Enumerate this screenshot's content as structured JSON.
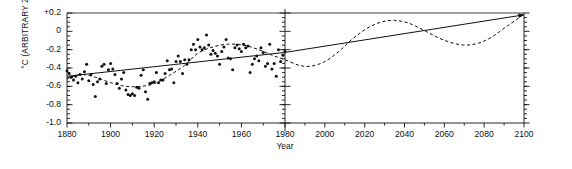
{
  "chart_data": {
    "type": "scatter",
    "title": "",
    "xlabel": "Year",
    "ylabel": "°C (ARBITRARY ZERO)",
    "xlim": [
      1880,
      2100
    ],
    "ylim": [
      -1.0,
      0.2
    ],
    "grid": false,
    "legend": "none",
    "panel_split_year": 1980,
    "y_ticks": [
      "+0.2",
      "0",
      "-0.2",
      "-0.4",
      "-0.6",
      "-0.8",
      "-1.0"
    ],
    "y_tick_values": [
      0.2,
      0.0,
      -0.2,
      -0.4,
      -0.6,
      -0.8,
      -1.0
    ],
    "y_minor_tick_step": 0.05,
    "x_ticks_left": [
      "1880",
      "1900",
      "1920",
      "1940",
      "1960",
      "1980"
    ],
    "x_tick_values_left": [
      1880,
      1900,
      1920,
      1940,
      1960,
      1980
    ],
    "x_ticks_right": [
      "2000",
      "2020",
      "2040",
      "2060",
      "2080",
      "2100"
    ],
    "x_tick_values_right": [
      2000,
      2020,
      2040,
      2060,
      2080,
      2100
    ],
    "x_minor_tick_step": 5,
    "series": [
      {
        "name": "observed-annual-anomaly",
        "type": "scatter",
        "marker": "filled-circle",
        "color": "#111111",
        "points": [
          [
            1880,
            -0.43
          ],
          [
            1881,
            -0.46
          ],
          [
            1882,
            -0.5
          ],
          [
            1883,
            -0.53
          ],
          [
            1884,
            -0.49
          ],
          [
            1885,
            -0.56
          ],
          [
            1886,
            -0.47
          ],
          [
            1887,
            -0.52
          ],
          [
            1888,
            -0.44
          ],
          [
            1889,
            -0.36
          ],
          [
            1890,
            -0.54
          ],
          [
            1891,
            -0.47
          ],
          [
            1892,
            -0.58
          ],
          [
            1893,
            -0.71
          ],
          [
            1894,
            -0.55
          ],
          [
            1895,
            -0.52
          ],
          [
            1896,
            -0.38
          ],
          [
            1897,
            -0.36
          ],
          [
            1898,
            -0.57
          ],
          [
            1899,
            -0.42
          ],
          [
            1900,
            -0.35
          ],
          [
            1901,
            -0.41
          ],
          [
            1902,
            -0.47
          ],
          [
            1903,
            -0.57
          ],
          [
            1904,
            -0.62
          ],
          [
            1905,
            -0.52
          ],
          [
            1906,
            -0.45
          ],
          [
            1907,
            -0.64
          ],
          [
            1908,
            -0.69
          ],
          [
            1909,
            -0.7
          ],
          [
            1910,
            -0.68
          ],
          [
            1911,
            -0.7
          ],
          [
            1912,
            -0.61
          ],
          [
            1913,
            -0.62
          ],
          [
            1914,
            -0.48
          ],
          [
            1915,
            -0.42
          ],
          [
            1916,
            -0.66
          ],
          [
            1917,
            -0.74
          ],
          [
            1918,
            -0.57
          ],
          [
            1919,
            -0.56
          ],
          [
            1920,
            -0.55
          ],
          [
            1921,
            -0.45
          ],
          [
            1922,
            -0.56
          ],
          [
            1923,
            -0.53
          ],
          [
            1924,
            -0.53
          ],
          [
            1925,
            -0.46
          ],
          [
            1926,
            -0.32
          ],
          [
            1927,
            -0.42
          ],
          [
            1928,
            -0.41
          ],
          [
            1929,
            -0.56
          ],
          [
            1930,
            -0.33
          ],
          [
            1931,
            -0.27
          ],
          [
            1932,
            -0.33
          ],
          [
            1933,
            -0.46
          ],
          [
            1934,
            -0.31
          ],
          [
            1935,
            -0.36
          ],
          [
            1936,
            -0.31
          ],
          [
            1937,
            -0.2
          ],
          [
            1938,
            -0.14
          ],
          [
            1939,
            -0.2
          ],
          [
            1940,
            -0.09
          ],
          [
            1941,
            -0.17
          ],
          [
            1942,
            -0.2
          ],
          [
            1943,
            -0.18
          ],
          [
            1944,
            -0.04
          ],
          [
            1945,
            -0.15
          ],
          [
            1946,
            -0.25
          ],
          [
            1947,
            -0.21
          ],
          [
            1948,
            -0.24
          ],
          [
            1949,
            -0.27
          ],
          [
            1950,
            -0.36
          ],
          [
            1951,
            -0.22
          ],
          [
            1952,
            -0.17
          ],
          [
            1953,
            -0.09
          ],
          [
            1954,
            -0.29
          ],
          [
            1955,
            -0.3
          ],
          [
            1956,
            -0.42
          ],
          [
            1957,
            -0.18
          ],
          [
            1958,
            -0.15
          ],
          [
            1959,
            -0.19
          ],
          [
            1960,
            -0.22
          ],
          [
            1961,
            -0.14
          ],
          [
            1962,
            -0.18
          ],
          [
            1963,
            -0.16
          ],
          [
            1964,
            -0.45
          ],
          [
            1965,
            -0.36
          ],
          [
            1966,
            -0.3
          ],
          [
            1967,
            -0.27
          ],
          [
            1968,
            -0.32
          ],
          [
            1969,
            -0.18
          ],
          [
            1970,
            -0.23
          ],
          [
            1971,
            -0.38
          ],
          [
            1972,
            -0.35
          ],
          [
            1973,
            -0.14
          ],
          [
            1974,
            -0.41
          ],
          [
            1975,
            -0.35
          ],
          [
            1976,
            -0.49
          ],
          [
            1977,
            -0.2
          ],
          [
            1978,
            -0.33
          ],
          [
            1979,
            -0.26
          ],
          [
            1980,
            -0.22
          ]
        ]
      },
      {
        "name": "linear-trend",
        "type": "line",
        "style": "solid",
        "color": "#111111",
        "arrow_end": true,
        "points": [
          [
            1880,
            -0.49
          ],
          [
            1980,
            -0.23
          ],
          [
            2100,
            0.18
          ]
        ]
      },
      {
        "name": "cyclic-projection",
        "type": "line",
        "style": "dashed",
        "color": "#111111",
        "points": [
          [
            1880,
            -0.52
          ],
          [
            1886,
            -0.47
          ],
          [
            1893,
            -0.5
          ],
          [
            1900,
            -0.56
          ],
          [
            1907,
            -0.6
          ],
          [
            1914,
            -0.6
          ],
          [
            1920,
            -0.57
          ],
          [
            1927,
            -0.48
          ],
          [
            1934,
            -0.37
          ],
          [
            1940,
            -0.24
          ],
          [
            1947,
            -0.17
          ],
          [
            1954,
            -0.14
          ],
          [
            1961,
            -0.15
          ],
          [
            1968,
            -0.2
          ],
          [
            1974,
            -0.26
          ],
          [
            1980,
            -0.31
          ],
          [
            1987,
            -0.37
          ],
          [
            1993,
            -0.38
          ],
          [
            2000,
            -0.33
          ],
          [
            2007,
            -0.22
          ],
          [
            2014,
            -0.08
          ],
          [
            2021,
            0.03
          ],
          [
            2028,
            0.1
          ],
          [
            2035,
            0.12
          ],
          [
            2042,
            0.09
          ],
          [
            2049,
            0.02
          ],
          [
            2056,
            -0.06
          ],
          [
            2063,
            -0.12
          ],
          [
            2070,
            -0.15
          ],
          [
            2077,
            -0.13
          ],
          [
            2084,
            -0.06
          ],
          [
            2091,
            0.05
          ],
          [
            2097,
            0.14
          ],
          [
            2100,
            0.19
          ]
        ]
      }
    ]
  },
  "axes": {
    "y_axis_title": "°C (ARBITRARY ZERO)",
    "x_axis_title": "Year"
  }
}
